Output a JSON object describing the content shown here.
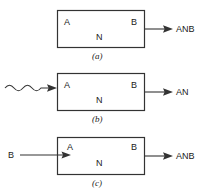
{
  "figure": {
    "caption_style": "italic-parenthesized",
    "colors": {
      "line": "#333333",
      "text": "#1a1a1a",
      "background": "#ffffff"
    },
    "panels": [
      {
        "id": "a",
        "caption": "(a)",
        "box": {
          "input_port_label": "A",
          "output_port_label": "B",
          "body_label": "N"
        },
        "input": {
          "type": "none",
          "label": ""
        },
        "output": {
          "type": "straight-arrow",
          "label": "ANB"
        }
      },
      {
        "id": "b",
        "caption": "(b)",
        "box": {
          "input_port_label": "A",
          "output_port_label": "B",
          "body_label": "N"
        },
        "input": {
          "type": "wavy-arrow",
          "label": ""
        },
        "output": {
          "type": "straight-arrow",
          "label": "AN"
        }
      },
      {
        "id": "c",
        "caption": "(c)",
        "box": {
          "input_port_label": "A",
          "output_port_label": "B",
          "body_label": "N"
        },
        "input": {
          "type": "straight-arrow",
          "label": "B"
        },
        "output": {
          "type": "straight-arrow",
          "label": "ANB"
        }
      }
    ]
  }
}
